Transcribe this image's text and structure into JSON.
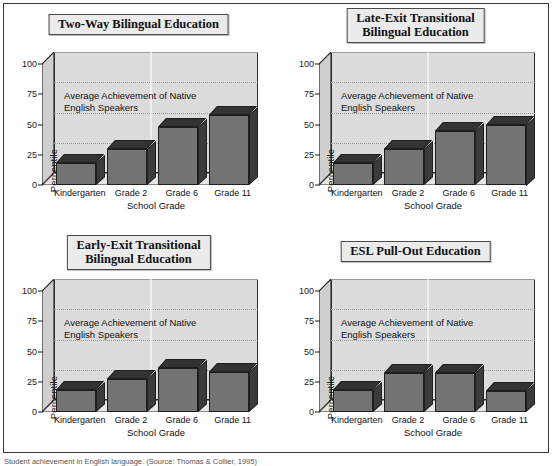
{
  "figure": {
    "caption": "Student achievement in English language. (Source: Thomas & Collier, 1995)",
    "annotation": "Average Achievement of Native\nEnglish Speakers",
    "axis": {
      "ylabel": "Percentile",
      "xlabel": "School Grade",
      "yticks": [
        "100",
        "75",
        "50",
        "25",
        "0"
      ],
      "ylim": [
        0,
        100
      ],
      "categories": [
        "Kindergarten",
        "Grade 2",
        "Grade 6",
        "Grade 11"
      ]
    },
    "colors": {
      "bar_front": "#737373",
      "bar_top": "#333333",
      "bar_side": "#3b3b3b",
      "plot_background": "#dcdcdc",
      "frame": "#2d2d2d",
      "title_background": "#ebebeb"
    }
  },
  "chart_data": [
    {
      "type": "bar",
      "title": "Two-Way Bilingual Education",
      "categories": [
        "Kindergarten",
        "Grade 2",
        "Grade 6",
        "Grade 11"
      ],
      "values": [
        18,
        30,
        48,
        58
      ],
      "xlabel": "School Grade",
      "ylabel": "Percentile",
      "ylim": [
        0,
        100
      ],
      "yticks": [
        0,
        25,
        50,
        75,
        100
      ],
      "grid": true,
      "annotation": "Average Achievement of Native English Speakers",
      "legend": null
    },
    {
      "type": "bar",
      "title": "Late-Exit Transitional Bilingual Education",
      "categories": [
        "Kindergarten",
        "Grade 2",
        "Grade 6",
        "Grade 11"
      ],
      "values": [
        18,
        30,
        45,
        50
      ],
      "xlabel": "School Grade",
      "ylabel": "Percentile",
      "ylim": [
        0,
        100
      ],
      "yticks": [
        0,
        25,
        50,
        75,
        100
      ],
      "grid": true,
      "annotation": "Average Achievement of Native English Speakers",
      "legend": null
    },
    {
      "type": "bar",
      "title": "Early-Exit Transitional Bilingual Education",
      "categories": [
        "Kindergarten",
        "Grade 2",
        "Grade 6",
        "Grade 11"
      ],
      "values": [
        18,
        27,
        36,
        33
      ],
      "xlabel": "School Grade",
      "ylabel": "Percentile",
      "ylim": [
        0,
        100
      ],
      "yticks": [
        0,
        25,
        50,
        75,
        100
      ],
      "grid": true,
      "annotation": "Average Achievement of Native English Speakers",
      "legend": null
    },
    {
      "type": "bar",
      "title": "ESL Pull-Out Education",
      "categories": [
        "Kindergarten",
        "Grade 2",
        "Grade 6",
        "Grade 11"
      ],
      "values": [
        18,
        32,
        32,
        17
      ],
      "xlabel": "School Grade",
      "ylabel": "Percentile",
      "ylim": [
        0,
        100
      ],
      "yticks": [
        0,
        25,
        50,
        75,
        100
      ],
      "grid": true,
      "annotation": "Average Achievement of Native English Speakers",
      "legend": null
    }
  ],
  "panels": [
    {
      "title_line1": "Two-Way Bilingual Education",
      "title_line2": ""
    },
    {
      "title_line1": "Late-Exit Transitional",
      "title_line2": "Bilingual Education"
    },
    {
      "title_line1": "Early-Exit Transitional",
      "title_line2": "Bilingual Education"
    },
    {
      "title_line1": "ESL Pull-Out Education",
      "title_line2": ""
    }
  ]
}
